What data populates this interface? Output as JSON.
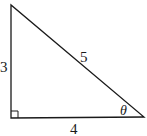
{
  "diagram": {
    "type": "right-triangle",
    "labels": {
      "vertical_leg": "3",
      "horizontal_leg": "4",
      "hypotenuse": "5",
      "angle": "θ"
    },
    "right_angle_marker": true,
    "stroke_color": "#1a1a1a",
    "background": "#ffffff"
  }
}
